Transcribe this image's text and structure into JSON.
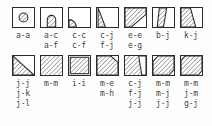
{
  "figure": {
    "colors": {
      "outline": "#2b2b2b",
      "hatch": "#555555",
      "background": "#ffffff",
      "label_text": "#3f3f3f"
    },
    "rows": [
      {
        "row_index": 1,
        "cells": [
          {
            "icon": "square-with-hatched-circle-icon",
            "shape": "circle-center",
            "labels": [
              "a-a"
            ]
          },
          {
            "icon": "square-with-hatched-dome-icon",
            "shape": "dome-bottom-center",
            "labels": [
              "a-c",
              "a-f"
            ]
          },
          {
            "icon": "square-with-hatched-quarter-corner-icon",
            "shape": "quarter-circle-bottom-left",
            "labels": [
              "c-c",
              "c-f"
            ]
          },
          {
            "icon": "square-with-narrow-hatched-wedge-icon",
            "shape": "narrow-left-wedge",
            "labels": [
              "c-j",
              "f-j"
            ]
          },
          {
            "icon": "square-with-large-hatched-triangle-icon",
            "shape": "upper-left-triangle",
            "labels": [
              "e-e",
              "e-g"
            ]
          },
          {
            "icon": "square-with-vertical-hatched-band-icon",
            "shape": "vertical-band",
            "labels": [
              "b-j"
            ]
          },
          {
            "icon": "square-with-hatched-trapezoid-icon",
            "shape": "left-trapezoid",
            "labels": [
              "k-j"
            ]
          }
        ]
      },
      {
        "row_index": 2,
        "cells": [
          {
            "icon": "square-with-hatched-half-diagonal-icon",
            "shape": "lower-left-triangle",
            "labels": [
              "j-j",
              "j-k",
              "j-l"
            ]
          },
          {
            "icon": "square-fully-hatched-icon",
            "shape": "full-square",
            "labels": [
              "m-m"
            ]
          },
          {
            "icon": "square-fully-hatched-inset-icon",
            "shape": "full-square-inset",
            "labels": [
              "i-i"
            ]
          },
          {
            "icon": "square-hatched-clipped-corner-icon",
            "shape": "clipped-top-right",
            "labels": [
              "m-e",
              "m-h"
            ]
          },
          {
            "icon": "square-hatched-with-notch-icon",
            "shape": "notched-right",
            "labels": [
              "c-j",
              "f-j",
              "j-j"
            ]
          },
          {
            "icon": "square-hatched-octagonal-icon",
            "shape": "octagon",
            "labels": [
              "m-m",
              "m-j",
              "j-j"
            ]
          },
          {
            "icon": "square-hatched-beveled-icon",
            "shape": "beveled-square",
            "labels": [
              "m-m",
              "j-m",
              "g-j"
            ]
          }
        ]
      }
    ]
  }
}
